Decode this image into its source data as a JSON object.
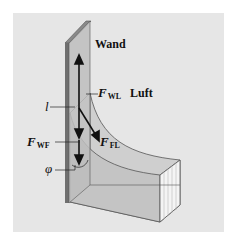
{
  "figure": {
    "background_color": "#e6e6e6",
    "wall_color": "#bdbdbd",
    "wall_edge_color": "#6f6f6f",
    "fluid_color": "#cfcfcf",
    "fluid_end_color": "#f4f4f4",
    "labels": {
      "wall": "Wand",
      "air": "Luft",
      "length": "l",
      "angle": "φ",
      "force_wall_air": {
        "main": "F",
        "sub": "WL"
      },
      "force_fluid_air": {
        "main": "F",
        "sub": "FL"
      },
      "force_wall_fluid": {
        "main": "F",
        "sub": "WF"
      }
    }
  }
}
